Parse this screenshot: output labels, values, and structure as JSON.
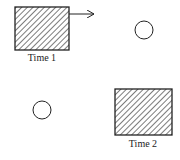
{
  "diagram": {
    "panels": [
      {
        "label": "Time 1",
        "rect": {
          "x": 15,
          "y": 7,
          "w": 54,
          "h": 43
        },
        "arrow": true,
        "circle": {
          "cx": 144,
          "cy": 30,
          "r": 9
        }
      },
      {
        "label": "Time 2",
        "rect": {
          "x": 115,
          "y": 89,
          "w": 57,
          "h": 46
        },
        "arrow": false,
        "circle": {
          "cx": 42,
          "cy": 110,
          "r": 9
        }
      }
    ],
    "colors": {
      "stroke": "#222222",
      "background": "#ffffff"
    }
  }
}
